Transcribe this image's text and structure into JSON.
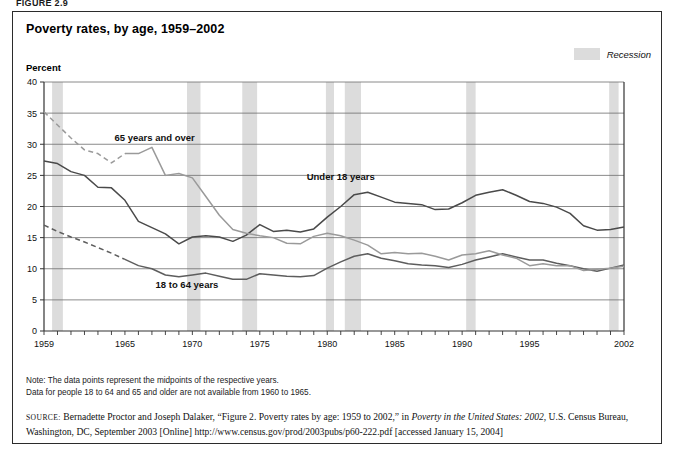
{
  "figure_caption": "FIGURE 2.9",
  "chart_title": "Poverty rates, by age, 1959–2002",
  "legend": {
    "recession_label": "Recession",
    "recession_color": "#dcdcdc"
  },
  "axis": {
    "y_title": "Percent"
  },
  "series_labels": {
    "over65": "65 years and over",
    "under18": "Under 18 years",
    "adults": "18 to 64 years"
  },
  "end_labels": {
    "under18": "16.7 percent",
    "adults": "10.6 percent",
    "over65": "10.4 percent"
  },
  "notes": {
    "line1": "Note: The data points represent the midpoints of the respective years.",
    "line2": "Data for people 18 to 64 and 65 and older are not available from 1960 to 1965."
  },
  "source": {
    "prefix": "source:",
    "text_a": " Bernadette Proctor and Joseph Dalaker, “Figure 2. Poverty rates by age: 1959 to 2002,” in ",
    "italic_a": "Poverty in the United States: 2002",
    "text_b": ", U.S. Census Bureau, Washington, DC, September 2003 [Online] http://www.census.gov/prod/2003pubs/p60-222.pdf [accessed January 15, 2004]"
  },
  "chart_data": {
    "type": "line",
    "title": "Poverty rates, by age, 1959–2002",
    "xlabel": "",
    "ylabel": "Percent",
    "ylim": [
      0,
      40
    ],
    "xlim": [
      1959,
      2002
    ],
    "ytick_step": 5,
    "yticks": [
      0,
      5,
      10,
      15,
      20,
      25,
      30,
      35,
      40
    ],
    "xticks_labeled": [
      1959,
      1965,
      1970,
      1975,
      1980,
      1985,
      1990,
      1995,
      2002
    ],
    "x_minor_ticks_every": 1,
    "grid": "horizontal",
    "legend_position": "inline-annotations",
    "x": [
      1959,
      1960,
      1961,
      1962,
      1963,
      1964,
      1965,
      1966,
      1967,
      1968,
      1969,
      1970,
      1971,
      1972,
      1973,
      1974,
      1975,
      1976,
      1977,
      1978,
      1979,
      1980,
      1981,
      1982,
      1983,
      1984,
      1985,
      1986,
      1987,
      1988,
      1989,
      1990,
      1991,
      1992,
      1993,
      1994,
      1995,
      1996,
      1997,
      1998,
      1999,
      2000,
      2001,
      2002
    ],
    "series": [
      {
        "name": "Under 18 years",
        "color": "#4a4a4a",
        "style": "solid",
        "end_label": "16.7 percent",
        "values": [
          27.3,
          26.9,
          25.6,
          25.0,
          23.1,
          23.0,
          21.0,
          17.6,
          16.6,
          15.6,
          14.0,
          15.1,
          15.3,
          15.1,
          14.4,
          15.4,
          17.1,
          16.0,
          16.2,
          15.9,
          16.4,
          18.3,
          20.0,
          21.9,
          22.3,
          21.5,
          20.7,
          20.5,
          20.3,
          19.5,
          19.6,
          20.6,
          21.8,
          22.3,
          22.7,
          21.8,
          20.8,
          20.5,
          19.9,
          18.9,
          16.9,
          16.2,
          16.3,
          16.7
        ]
      },
      {
        "name": "18 to 64 years",
        "color": "#5d5d5d",
        "style": "dashed-then-solid",
        "dashed_through": 1965,
        "end_label": "10.6 percent",
        "values": [
          17.0,
          16.0,
          15.1,
          14.3,
          13.4,
          12.5,
          11.5,
          10.5,
          10.0,
          9.0,
          8.7,
          9.0,
          9.3,
          8.8,
          8.3,
          8.3,
          9.2,
          9.0,
          8.8,
          8.7,
          8.9,
          10.1,
          11.1,
          12.0,
          12.4,
          11.7,
          11.3,
          10.8,
          10.6,
          10.5,
          10.2,
          10.7,
          11.4,
          11.9,
          12.4,
          11.9,
          11.4,
          11.4,
          10.9,
          10.5,
          10.0,
          9.6,
          10.1,
          10.6
        ]
      },
      {
        "name": "65 years and over",
        "color": "#9a9a9a",
        "style": "dashed-then-solid",
        "dashed_through": 1965,
        "end_label": "10.4 percent",
        "values": [
          35.2,
          33.1,
          31.0,
          29.1,
          28.5,
          27.0,
          28.5,
          28.5,
          29.5,
          25.0,
          25.3,
          24.6,
          21.6,
          18.6,
          16.3,
          15.7,
          15.3,
          15.0,
          14.1,
          14.0,
          15.2,
          15.7,
          15.3,
          14.6,
          13.8,
          12.4,
          12.6,
          12.4,
          12.5,
          12.0,
          11.4,
          12.2,
          12.4,
          12.9,
          12.2,
          11.7,
          10.5,
          10.8,
          10.5,
          10.5,
          9.7,
          9.9,
          10.1,
          10.4
        ]
      }
    ],
    "recession_bands": [
      {
        "start": 1959.6,
        "end": 1960.4
      },
      {
        "start": 1969.6,
        "end": 1970.6
      },
      {
        "start": 1973.7,
        "end": 1974.8
      },
      {
        "start": 1979.9,
        "end": 1980.5
      },
      {
        "start": 1981.3,
        "end": 1982.5
      },
      {
        "start": 1990.3,
        "end": 1991.0
      },
      {
        "start": 2000.9,
        "end": 2001.6
      }
    ]
  }
}
